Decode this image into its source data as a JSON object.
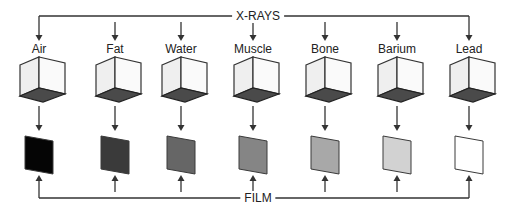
{
  "diagram": {
    "source_label": "X-RAYS",
    "receiver_label": "FILM",
    "line_color": "#333333",
    "cube_bottom_color": "#4a4a4a",
    "cube_side_color": "#efefef",
    "cube_front_color": "#fafafa",
    "materials": [
      {
        "label": "Air",
        "x": 39,
        "film_color": "#050505"
      },
      {
        "label": "Fat",
        "x": 115,
        "film_color": "#3a3a3a"
      },
      {
        "label": "Water",
        "x": 181,
        "film_color": "#666666"
      },
      {
        "label": "Muscle",
        "x": 253,
        "film_color": "#858585"
      },
      {
        "label": "Bone",
        "x": 325,
        "film_color": "#a8a8a8"
      },
      {
        "label": "Barium",
        "x": 397,
        "film_color": "#d2d2d2"
      },
      {
        "label": "Lead",
        "x": 469,
        "film_color": "#ffffff"
      }
    ]
  }
}
